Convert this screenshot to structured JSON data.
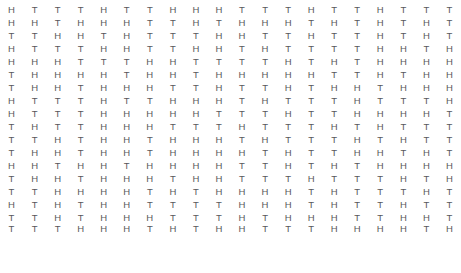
{
  "page": {
    "text_color": "#58585c",
    "background_color": "#ffffff",
    "columns": 20,
    "rows": 18,
    "symbols": [
      "H",
      "T"
    ]
  },
  "grid": {
    "rows": [
      [
        "H",
        "T",
        "T",
        "T",
        "H",
        "T",
        "T",
        "H",
        "H",
        "H",
        "T",
        "T",
        "T",
        "H",
        "T",
        "T",
        "H",
        "T",
        "T",
        "T"
      ],
      [
        "H",
        "H",
        "T",
        "H",
        "H",
        "H",
        "T",
        "T",
        "H",
        "T",
        "H",
        "H",
        "H",
        "T",
        "H",
        "T",
        "H",
        "T",
        "H",
        "T"
      ],
      [
        "T",
        "T",
        "H",
        "H",
        "T",
        "H",
        "T",
        "T",
        "T",
        "H",
        "H",
        "T",
        "T",
        "H",
        "T",
        "T",
        "H",
        "T",
        "H",
        "T"
      ],
      [
        "H",
        "T",
        "T",
        "T",
        "H",
        "H",
        "T",
        "T",
        "H",
        "H",
        "T",
        "H",
        "T",
        "T",
        "T",
        "T",
        "H",
        "H",
        "T",
        "H"
      ],
      [
        "H",
        "H",
        "H",
        "T",
        "T",
        "T",
        "H",
        "H",
        "T",
        "T",
        "T",
        "T",
        "H",
        "T",
        "H",
        "T",
        "H",
        "H",
        "H",
        "H"
      ],
      [
        "T",
        "H",
        "H",
        "H",
        "H",
        "T",
        "H",
        "H",
        "T",
        "H",
        "H",
        "H",
        "H",
        "H",
        "T",
        "T",
        "H",
        "T",
        "H",
        "H"
      ],
      [
        "T",
        "H",
        "H",
        "T",
        "H",
        "H",
        "H",
        "T",
        "T",
        "H",
        "T",
        "T",
        "H",
        "T",
        "H",
        "H",
        "T",
        "H",
        "H",
        "H"
      ],
      [
        "H",
        "T",
        "T",
        "T",
        "H",
        "T",
        "T",
        "H",
        "H",
        "H",
        "T",
        "H",
        "T",
        "T",
        "T",
        "H",
        "T",
        "T",
        "T",
        "H"
      ],
      [
        "H",
        "T",
        "T",
        "T",
        "H",
        "H",
        "H",
        "H",
        "H",
        "T",
        "T",
        "T",
        "H",
        "T",
        "T",
        "H",
        "H",
        "H",
        "H",
        "T"
      ],
      [
        "T",
        "H",
        "T",
        "T",
        "H",
        "H",
        "H",
        "T",
        "T",
        "T",
        "H",
        "T",
        "T",
        "T",
        "H",
        "T",
        "H",
        "T",
        "T",
        "T"
      ],
      [
        "T",
        "T",
        "H",
        "T",
        "H",
        "H",
        "T",
        "H",
        "H",
        "H",
        "T",
        "H",
        "T",
        "T",
        "T",
        "H",
        "T",
        "H",
        "T",
        "T"
      ],
      [
        "T",
        "H",
        "H",
        "T",
        "H",
        "H",
        "T",
        "H",
        "H",
        "H",
        "H",
        "T",
        "H",
        "T",
        "T",
        "H",
        "H",
        "T",
        "H",
        "T"
      ],
      [
        "H",
        "H",
        "T",
        "H",
        "H",
        "T",
        "H",
        "H",
        "H",
        "H",
        "T",
        "T",
        "H",
        "T",
        "H",
        "T",
        "H",
        "H",
        "H",
        "H"
      ],
      [
        "T",
        "H",
        "H",
        "T",
        "H",
        "H",
        "H",
        "T",
        "H",
        "H",
        "T",
        "T",
        "T",
        "H",
        "T",
        "T",
        "T",
        "H",
        "T",
        "H"
      ],
      [
        "T",
        "T",
        "H",
        "H",
        "H",
        "H",
        "T",
        "H",
        "T",
        "H",
        "H",
        "H",
        "H",
        "T",
        "H",
        "T",
        "T",
        "T",
        "H",
        "T"
      ],
      [
        "H",
        "T",
        "H",
        "T",
        "H",
        "H",
        "T",
        "T",
        "T",
        "T",
        "H",
        "H",
        "H",
        "T",
        "H",
        "T",
        "T",
        "H",
        "T",
        "T"
      ],
      [
        "T",
        "T",
        "H",
        "T",
        "H",
        "H",
        "H",
        "T",
        "T",
        "T",
        "H",
        "T",
        "H",
        "H",
        "H",
        "T",
        "T",
        "H",
        "H",
        "T"
      ],
      [
        "T",
        "T",
        "T",
        "H",
        "H",
        "H",
        "T",
        "H",
        "T",
        "H",
        "H",
        "T",
        "T",
        "T",
        "H",
        "H",
        "H",
        "H",
        "T",
        "H"
      ]
    ]
  }
}
